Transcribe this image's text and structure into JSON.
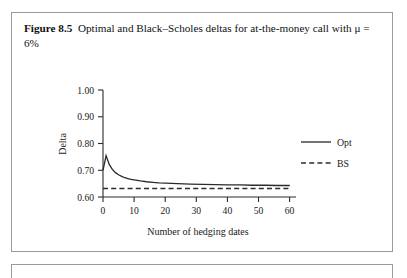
{
  "figure": {
    "label": "Figure 8.5",
    "caption": "Optimal and Black–Scholes deltas for at-the-money call with μ = 6%"
  },
  "chart_data": {
    "type": "line",
    "title": "",
    "xlabel": "Number of hedging dates",
    "ylabel": "Delta",
    "xlim": [
      0,
      62
    ],
    "ylim": [
      0.6,
      1.0
    ],
    "xticks": [
      0,
      10,
      20,
      30,
      40,
      50,
      60
    ],
    "xtick_labels": [
      "0",
      "10",
      "20",
      "30",
      "40",
      "50",
      "60"
    ],
    "yticks": [
      0.6,
      0.7,
      0.8,
      0.9,
      1.0
    ],
    "ytick_labels": [
      "0.60",
      "0.70",
      "0.80",
      "0.90",
      "1.00"
    ],
    "grid": false,
    "legend_position": "right",
    "series": [
      {
        "name": "Opt",
        "style": "solid",
        "color": "#2b2b2b",
        "x": [
          0,
          1,
          2,
          3,
          4,
          5,
          6,
          7,
          8,
          9,
          10,
          12,
          14,
          16,
          18,
          20,
          24,
          28,
          32,
          36,
          40,
          44,
          48,
          52,
          56,
          60
        ],
        "y": [
          0.7,
          0.755,
          0.722,
          0.703,
          0.691,
          0.683,
          0.677,
          0.672,
          0.669,
          0.666,
          0.664,
          0.66,
          0.657,
          0.655,
          0.653,
          0.652,
          0.65,
          0.648,
          0.647,
          0.646,
          0.645,
          0.645,
          0.644,
          0.644,
          0.643,
          0.643
        ]
      },
      {
        "name": "BS",
        "style": "dashed",
        "color": "#2b2b2b",
        "x": [
          0,
          60
        ],
        "y": [
          0.632,
          0.632
        ]
      }
    ],
    "legend": [
      {
        "label": "Opt",
        "style": "solid"
      },
      {
        "label": "BS",
        "style": "dashed"
      }
    ]
  }
}
